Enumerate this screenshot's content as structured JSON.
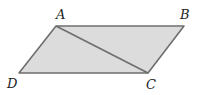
{
  "figure": {
    "type": "parallelogram",
    "fill": "#dcdcdc",
    "stroke": "#6e6e6e",
    "vertices": {
      "A": {
        "label": "A",
        "x": 56,
        "y": 26
      },
      "B": {
        "label": "B",
        "x": 184,
        "y": 26
      },
      "C": {
        "label": "C",
        "x": 148,
        "y": 73
      },
      "D": {
        "label": "D",
        "x": 19,
        "y": 73
      }
    },
    "diagonal": [
      "A",
      "C"
    ]
  }
}
